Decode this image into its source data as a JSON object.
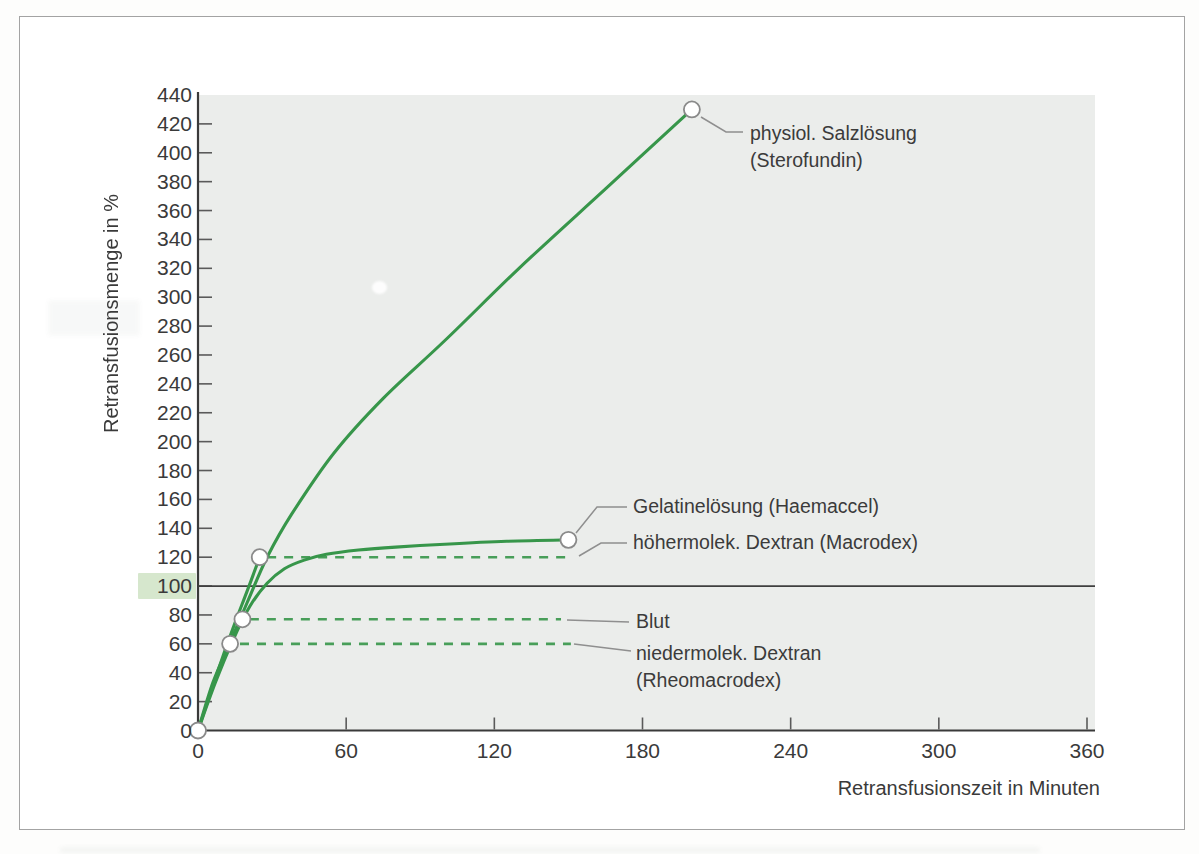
{
  "figure": {
    "x_axis_title": "Retransfusionszeit in Minuten",
    "y_axis_title": "Retransfusionsmenge in %"
  },
  "chart_data": {
    "type": "line",
    "title": "",
    "xlabel": "Retransfusionszeit in Minuten",
    "ylabel": "Retransfusionsmenge in %",
    "xlim": [
      0,
      360
    ],
    "ylim": [
      0,
      440
    ],
    "x_ticks": [
      0,
      60,
      120,
      180,
      240,
      300,
      360
    ],
    "y_ticks": [
      0,
      20,
      40,
      60,
      80,
      100,
      120,
      140,
      160,
      180,
      200,
      220,
      240,
      260,
      280,
      300,
      320,
      340,
      360,
      380,
      400,
      420,
      440
    ],
    "grid": false,
    "legend_position": "inline-annotations",
    "colors": {
      "curve_green": "#37964a",
      "plot_background": "#ebedeb",
      "axis": "#3a3a3a",
      "tick": "#5a5a5a",
      "reference_line": "#3f3f3f",
      "reference_highlight": "#d6e7cd",
      "leader_line": "#8f8f8f",
      "marker_stroke": "#8a8a8a",
      "marker_fill": "#ffffff",
      "text": "#3b3b3b"
    },
    "reference_line": {
      "y": 100,
      "highlighted_tick": 100
    },
    "origin_marker": [
      0,
      0
    ],
    "series": [
      {
        "name": "physiol. Salzlösung (Sterofundin)",
        "style": "solid",
        "points": [
          [
            0,
            0
          ],
          [
            6,
            33
          ],
          [
            13,
            61
          ],
          [
            20,
            89
          ],
          [
            28,
            120
          ],
          [
            38,
            150
          ],
          [
            55,
            192
          ],
          [
            75,
            230
          ],
          [
            100,
            270
          ],
          [
            130,
            320
          ],
          [
            165,
            375
          ],
          [
            200,
            430
          ]
        ],
        "end_marker": [
          200,
          430
        ]
      },
      {
        "name": "Gelatinelösung (Haemaccel)",
        "style": "solid",
        "points": [
          [
            0,
            0
          ],
          [
            7,
            33
          ],
          [
            14,
            62
          ],
          [
            21,
            86
          ],
          [
            28,
            102
          ],
          [
            35,
            112
          ],
          [
            43,
            118
          ],
          [
            52,
            122
          ],
          [
            65,
            125
          ],
          [
            80,
            127
          ],
          [
            100,
            129
          ],
          [
            125,
            131
          ],
          [
            150,
            132
          ]
        ],
        "end_marker": [
          150,
          132
        ]
      },
      {
        "name": "höhermolek. Dextran (Macrodex)",
        "style": "solid_then_dashed",
        "points": [
          [
            0,
            0
          ],
          [
            7,
            36
          ],
          [
            14,
            70
          ],
          [
            20,
            97
          ],
          [
            25,
            120
          ]
        ],
        "end_marker": [
          25,
          120
        ],
        "dashed_segment": {
          "y": 120,
          "x_from": 28,
          "x_to": 150
        }
      },
      {
        "name": "Blut",
        "style": "marker_then_dashed",
        "end_marker": [
          18,
          77
        ],
        "dashed_segment": {
          "y": 77,
          "x_from": 21,
          "x_to": 147
        }
      },
      {
        "name": "niedermolek. Dextran (Rheomacrodex)",
        "style": "marker_then_dashed",
        "end_marker": [
          13,
          60
        ],
        "dashed_segment": {
          "y": 60,
          "x_from": 17,
          "x_to": 151
        }
      }
    ],
    "annotations": [
      {
        "id": "sterofundin",
        "lines": [
          "physiol. Salzlösung",
          "(Sterofundin)"
        ],
        "label_px": [
          750,
          120
        ],
        "leader_px": [
          [
            701,
            117
          ],
          [
            726,
            132
          ],
          [
            743,
            132
          ]
        ]
      },
      {
        "id": "haemaccel",
        "lines": [
          "Gelatinelösung (Haemaccel)"
        ],
        "label_px": [
          633,
          493
        ],
        "leader_px": [
          [
            576,
            533
          ],
          [
            597,
            507
          ],
          [
            627,
            507
          ]
        ]
      },
      {
        "id": "macrodex",
        "lines": [
          "höhermolek. Dextran (Macrodex)"
        ],
        "label_px": [
          633,
          529
        ],
        "leader_px": [
          [
            579,
            556
          ],
          [
            601,
            543
          ],
          [
            627,
            543
          ]
        ]
      },
      {
        "id": "blut",
        "lines": [
          "Blut"
        ],
        "label_px": [
          636,
          608
        ],
        "leader_px": [
          [
            567,
            620
          ],
          [
            629,
            622
          ]
        ]
      },
      {
        "id": "rheomacrodex",
        "lines": [
          "niedermolek. Dextran",
          "(Rheomacrodex)"
        ],
        "label_px": [
          636,
          640
        ],
        "leader_px": [
          [
            574,
            644
          ],
          [
            631,
            651
          ]
        ]
      }
    ]
  }
}
